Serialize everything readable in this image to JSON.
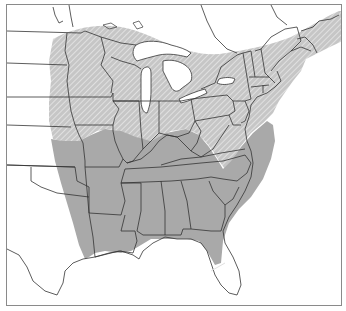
{
  "map": {
    "type": "range-map",
    "region": "Eastern United States",
    "colors": {
      "background": "#ffffff",
      "land": "#ffffff",
      "water": "#ffffff",
      "range_solid": "#a9a9a9",
      "range_hatched_bg": "#c4c4c4",
      "hatch_line": "#ffffff",
      "border": "#333333",
      "frame": "#8a8a8a"
    },
    "legend": [],
    "zones": [
      {
        "name": "hatched-range",
        "pattern": "diagonal-hatch",
        "area": "Northern range: Minnesota, Wisconsin, Iowa, Michigan, northern Illinois/Indiana, Ohio, Pennsylvania, New York, New England, southern Ontario/Quebec, Maritime Canada, Appalachian highlands"
      },
      {
        "name": "solid-range",
        "pattern": "solid",
        "area": "Southern range: eastern Kansas/Oklahoma/Texas, Missouri, Arkansas, Louisiana, Kentucky, Tennessee, Mississippi, Alabama, Georgia, Carolinas, Virginia, northern Florida"
      }
    ]
  }
}
